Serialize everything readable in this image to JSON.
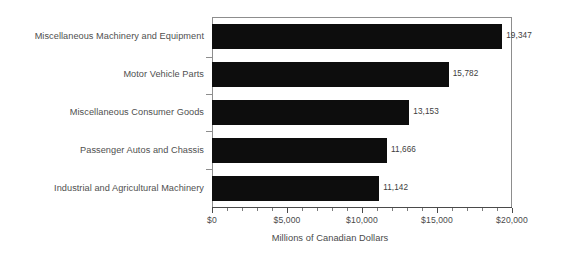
{
  "chart_data": {
    "type": "bar",
    "orientation": "horizontal",
    "title": "",
    "xlabel": "Millions of Canadian Dollars",
    "ylabel": "",
    "xlim": [
      0,
      20000
    ],
    "grid": false,
    "legend": false,
    "bar_color": "#0d0d0d",
    "axis_color": "#4a4a4a",
    "frame_color": "#8d8d8d",
    "text_color": "#4f4f4f",
    "categories": [
      "Miscellaneous Machinery and Equipment",
      "Motor Vehicle Parts",
      "Miscellaneous Consumer Goods",
      "Passenger Autos and Chassis",
      "Industrial and Agricultural Machinery"
    ],
    "values": [
      19347,
      15782,
      13153,
      11666,
      11142
    ],
    "value_labels": [
      "19,347",
      "15,782",
      "13,153",
      "11,666",
      "11,142"
    ],
    "xticks": [
      0,
      5000,
      10000,
      15000,
      20000
    ],
    "xtick_labels": [
      "$0",
      "$5,000",
      "$10,000",
      "$15,000",
      "$20,000"
    ],
    "minor_tick_step": 1000
  }
}
